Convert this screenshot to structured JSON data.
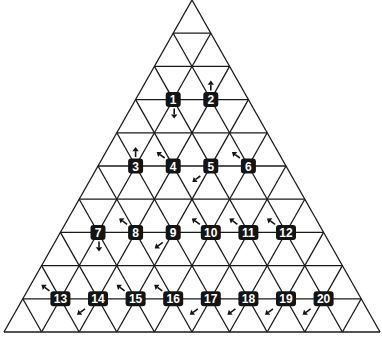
{
  "diagram": {
    "title": "",
    "colors": {
      "line": "#1a1a1a",
      "badge_fill": "#141414",
      "badge_text": "#ffffff",
      "background": "#ffffff"
    },
    "geometry": {
      "apex": [
        192,
        0
      ],
      "base_y": 332,
      "base_left_x": 4,
      "base_right_x": 380,
      "rows": 10
    },
    "nodes": [
      {
        "label": "1",
        "row": 3,
        "col": 1,
        "arrow": "down"
      },
      {
        "label": "2",
        "row": 3,
        "col": 2,
        "arrow": "up"
      },
      {
        "label": "3",
        "row": 5,
        "col": 1,
        "arrow": "up"
      },
      {
        "label": "4",
        "row": 5,
        "col": 2,
        "arrow": "up-left"
      },
      {
        "label": "5",
        "row": 5,
        "col": 3,
        "arrow": "down-left"
      },
      {
        "label": "6",
        "row": 5,
        "col": 4,
        "arrow": "up-left"
      },
      {
        "label": "7",
        "row": 7,
        "col": 1,
        "arrow": "down"
      },
      {
        "label": "8",
        "row": 7,
        "col": 2,
        "arrow": "up-left"
      },
      {
        "label": "9",
        "row": 7,
        "col": 3,
        "arrow": "down-left"
      },
      {
        "label": "10",
        "row": 7,
        "col": 4,
        "arrow": "up-left"
      },
      {
        "label": "11",
        "row": 7,
        "col": 5,
        "arrow": "up-left"
      },
      {
        "label": "12",
        "row": 7,
        "col": 6,
        "arrow": "up-left"
      },
      {
        "label": "13",
        "row": 9,
        "col": 1,
        "arrow": "up-left"
      },
      {
        "label": "14",
        "row": 9,
        "col": 2,
        "arrow": "down-left"
      },
      {
        "label": "15",
        "row": 9,
        "col": 3,
        "arrow": "up-left"
      },
      {
        "label": "16",
        "row": 9,
        "col": 4,
        "arrow": "up-left"
      },
      {
        "label": "17",
        "row": 9,
        "col": 5,
        "arrow": "down-left"
      },
      {
        "label": "18",
        "row": 9,
        "col": 6,
        "arrow": "down-left"
      },
      {
        "label": "19",
        "row": 9,
        "col": 7,
        "arrow": "down-left"
      },
      {
        "label": "20",
        "row": 9,
        "col": 8,
        "arrow": "down-left"
      }
    ]
  }
}
